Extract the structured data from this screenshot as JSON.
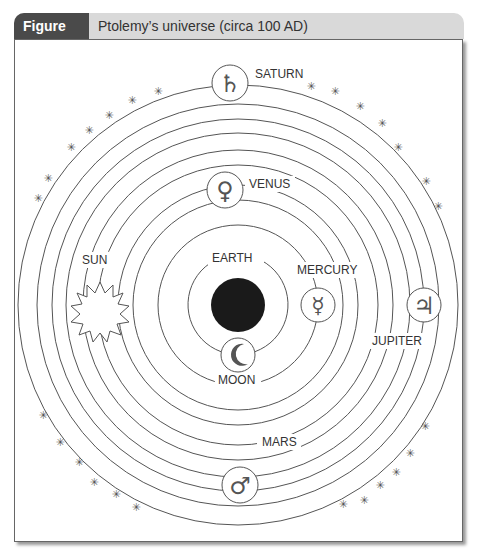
{
  "figure": {
    "number": "Figure 8.2",
    "title": "Ptolemy’s universe (circa 100 AD)"
  },
  "bodies": [
    {
      "name": "EARTH",
      "symbol": "earth-disc"
    },
    {
      "name": "MOON",
      "symbol": "crescent"
    },
    {
      "name": "MERCURY",
      "symbol": "☿"
    },
    {
      "name": "VENUS",
      "symbol": "♀"
    },
    {
      "name": "SUN",
      "symbol": "sun-burst"
    },
    {
      "name": "MARS",
      "symbol": "♂"
    },
    {
      "name": "JUPITER",
      "symbol": "♃"
    },
    {
      "name": "SATURN",
      "symbol": "♄"
    }
  ],
  "labels": {
    "earth": "EARTH",
    "moon": "MOON",
    "mercury": "MERCURY",
    "venus": "VENUS",
    "sun": "SUN",
    "mars": "MARS",
    "jupiter": "JUPITER",
    "saturn": "SATURN"
  },
  "symbols": {
    "mercury": "☿",
    "venus": "♀",
    "mars": "♂",
    "jupiter": "♃",
    "saturn": "♄",
    "star": "✳"
  },
  "colors": {
    "header_dark": "#4a4a4a",
    "header_light": "#d9d9d9",
    "line": "#444444",
    "earth": "#1a1a1a",
    "symbol": "#555555"
  }
}
